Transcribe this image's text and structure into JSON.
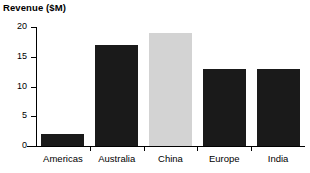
{
  "chart_data": {
    "type": "bar",
    "title": "Revenue ($M)",
    "xlabel": "",
    "ylabel": "",
    "categories": [
      "Americas",
      "Australia",
      "China",
      "Europe",
      "India"
    ],
    "values": [
      2,
      17,
      19,
      13,
      13
    ],
    "ylim": [
      0,
      20
    ],
    "yticks": [
      0,
      5,
      10,
      15,
      20
    ],
    "ytick_labels": [
      "0",
      "5",
      "10",
      "15",
      "20"
    ],
    "grid": false,
    "legend": null,
    "bar_colors": [
      "#1a1a1a",
      "#1a1a1a",
      "#d3d3d3",
      "#1a1a1a",
      "#1a1a1a"
    ],
    "highlight_category": "China",
    "colors": {
      "bar_dark": "#1a1a1a",
      "bar_light": "#d3d3d3",
      "axis": "#000000",
      "text": "#000000",
      "background": "#ffffff"
    }
  }
}
